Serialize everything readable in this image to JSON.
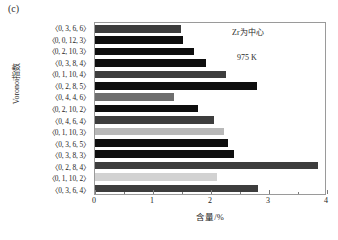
{
  "panel": {
    "label": "(c)"
  },
  "annotations": {
    "center": "Zr为中心",
    "temperature": "975 K"
  },
  "axes": {
    "x_title": "含量/%",
    "y_title": "Voronoi指数",
    "x_ticklabels": [
      "0",
      "1",
      "2",
      "3",
      "4"
    ]
  },
  "chart_data": {
    "type": "bar",
    "orientation": "horizontal",
    "title": "",
    "xlabel": "含量/%",
    "ylabel": "Voronoi指数",
    "xlim": [
      0,
      4
    ],
    "grid": false,
    "legend": null,
    "annotations": [
      "Zr为中心",
      "975 K"
    ],
    "categories": [
      "〈0, 3, 6, 6〉",
      "〈0, 0, 12, 3〉",
      "〈0, 2, 10, 3〉",
      "〈0, 3, 8, 4〉",
      "〈0, 1, 10, 4〉",
      "〈0, 2, 8, 5〉",
      "〈0, 4, 4, 6〉",
      "〈0, 2, 10, 2〉",
      "〈0, 4, 6, 4〉",
      "〈0, 1, 10, 3〉",
      "〈0, 3, 6, 5〉",
      "〈0, 3, 8, 3〉",
      "〈0, 2, 8, 4〉",
      "〈0, 1, 10, 2〉",
      "〈0, 3, 6, 4〉"
    ],
    "values": [
      1.48,
      1.52,
      1.7,
      1.92,
      2.26,
      2.79,
      1.36,
      1.78,
      2.05,
      2.22,
      2.29,
      2.4,
      3.84,
      2.1,
      2.81
    ],
    "shades": [
      "s-dark",
      "s-black",
      "s-black",
      "s-black",
      "s-dark",
      "s-black",
      "s-mid",
      "s-black",
      "s-dark",
      "s-light",
      "s-black",
      "s-black",
      "s-dark",
      "s-vlight",
      "s-dark"
    ]
  }
}
